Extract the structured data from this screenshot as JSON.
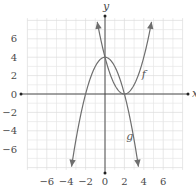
{
  "chart_data": {
    "type": "line",
    "title": "",
    "xlabel": "x",
    "ylabel": "y",
    "xlim": [
      -8,
      8
    ],
    "ylim": [
      -8.25,
      8.25
    ],
    "grid": true,
    "x_ticks": [
      -6,
      -4,
      -2,
      0,
      2,
      4,
      6
    ],
    "y_ticks": [
      6,
      4,
      2,
      0,
      -2,
      -4,
      -6
    ],
    "x_tick_labels": [
      "−6",
      "−4",
      "−2",
      "0",
      "2",
      "4",
      "6"
    ],
    "y_tick_labels": [
      "6",
      "4",
      "2",
      "0",
      "−2",
      "−4",
      "−6"
    ],
    "series": [
      {
        "name": "f",
        "expression": "(x-2)^2",
        "domain": [
          -0.8,
          4.8
        ],
        "arrows": "both-ends",
        "key_points": [
          [
            0,
            4
          ],
          [
            2,
            0
          ],
          [
            4,
            4
          ]
        ],
        "label_position": [
          3.8,
          1.7
        ]
      },
      {
        "name": "g",
        "expression": "4-x^2",
        "domain": [
          -3.45,
          3.45
        ],
        "arrows": "both-ends",
        "key_points": [
          [
            -2,
            0
          ],
          [
            0,
            4
          ],
          [
            2,
            0
          ]
        ],
        "label_position": [
          2.2,
          -5.0
        ]
      }
    ],
    "intersections": [
      [
        0,
        4
      ],
      [
        2,
        0
      ]
    ]
  },
  "labels": {
    "x_axis": "x",
    "y_axis": "y",
    "f": "f",
    "g": "g"
  },
  "colors": {
    "curve": "#6e6e6e",
    "axis": "#3c3c3c",
    "grid": "#e6e6e6",
    "grid_major": "#dcdcdc"
  }
}
